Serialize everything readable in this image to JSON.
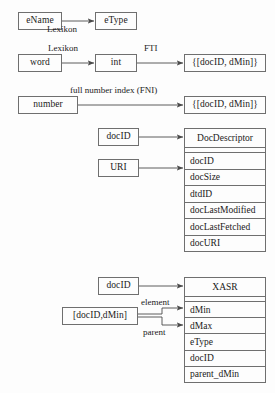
{
  "diagram": {
    "background_color": "#fdfdfd",
    "stroke_color": "#6f6f6f",
    "text_color": "#1a1a1a",
    "nodes": {
      "ename": "eName",
      "etype": "eType",
      "word": "word",
      "int": "int",
      "doclist_fti": "{[docID, dMin]}",
      "number": "number",
      "doclist_fni": "{[docID, dMin]}",
      "docid_dd": "docID",
      "uri": "URI",
      "docid_xasr": "docID",
      "docid_dmin_pair": "[docID,dMin]"
    },
    "edge_labels": {
      "lexikon_etype": "Lexikon",
      "lexikon_int": "Lexikon",
      "fti": "FTI",
      "fni": "full number index (FNI)",
      "element": "element",
      "parent": "parent"
    },
    "tables": [
      {
        "id": "docdescriptor",
        "header": "DocDescriptor",
        "rows": [
          "docID",
          "docSize",
          "dtdID",
          "docLastModified",
          "docLastFetched",
          "docURI"
        ]
      },
      {
        "id": "xasr",
        "header": "XASR",
        "rows": [
          "dMin",
          "dMax",
          "eType",
          "docID",
          "parent_dMin"
        ]
      }
    ]
  }
}
